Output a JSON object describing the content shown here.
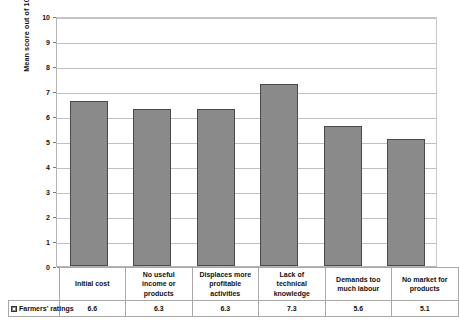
{
  "chart_data": {
    "type": "bar",
    "title": "",
    "xlabel": "",
    "ylabel": "Mean score out of 10",
    "ylim": [
      0,
      10
    ],
    "ytick_labels": [
      "10",
      "9",
      "8",
      "7",
      "6",
      "5",
      "4",
      "3",
      "2",
      "1",
      "0"
    ],
    "grid": true,
    "legend_position": "bottom-table",
    "categories": [
      "Initial cost",
      "No useful income or products",
      "Displaces more profitable activities",
      "Lack of technical knowledge",
      "Demands too much labour",
      "No market for products"
    ],
    "series": [
      {
        "name": "Farmers' ratings",
        "values": [
          6.6,
          6.3,
          6.3,
          7.3,
          5.6,
          5.1
        ],
        "color": "#8a8a8a"
      }
    ]
  },
  "axis": {
    "y_title": "Mean score out of 10"
  },
  "table": {
    "legend_label": "Farmers' ratings",
    "category_lines": [
      [
        "Initial cost"
      ],
      [
        "No useful",
        "income or",
        "products"
      ],
      [
        "Displaces more",
        "profitable",
        "activities"
      ],
      [
        "Lack of",
        "technical",
        "knowledge"
      ],
      [
        "Demands too",
        "much labour"
      ],
      [
        "No market for",
        "products"
      ]
    ],
    "value_labels": [
      "6.6",
      "6.3",
      "6.3",
      "7.3",
      "5.6",
      "5.1"
    ]
  },
  "colors": {
    "bar_fill": "#8a8a8a",
    "bar_stroke": "#4a4a4a",
    "gridline": "#c0c0c0",
    "background": "#ffffff"
  }
}
